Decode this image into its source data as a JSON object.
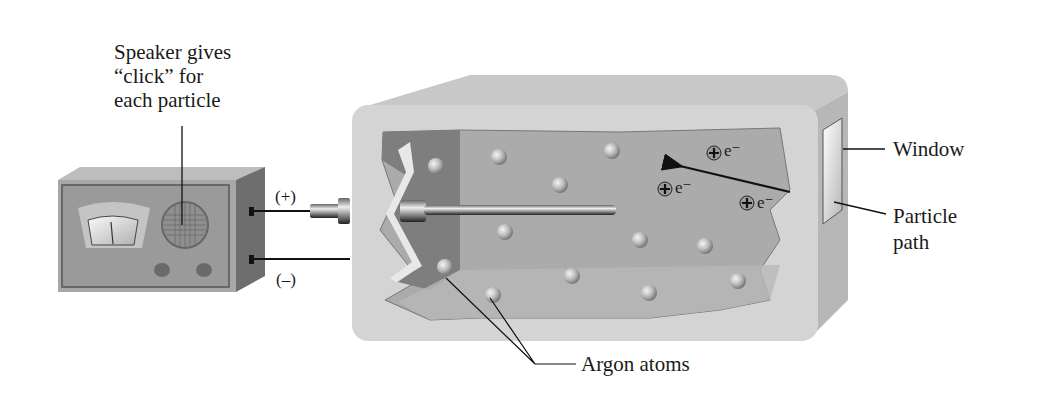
{
  "diagram": {
    "type": "Geiger counter schematic",
    "labels": {
      "speaker_line1": "Speaker gives",
      "speaker_line2": "“click” for",
      "speaker_line3": "each particle",
      "positive": "(+)",
      "negative": "(–)",
      "window": "Window",
      "particle_path_line1": "Particle",
      "particle_path_line2": "path",
      "argon_atoms": "Argon atoms"
    },
    "ion_pairs": [
      {
        "ion": "+",
        "electron": "e⁻"
      },
      {
        "ion": "+",
        "electron": "e⁻"
      },
      {
        "ion": "+",
        "electron": "e⁻"
      }
    ],
    "colors": {
      "chamber_outer": "#d4d4d4",
      "chamber_inner": "#a9a9a9",
      "chamber_dark": "#7e7e7e",
      "radio_body": "#9a9a9a",
      "text": "#1a1a1a"
    }
  }
}
